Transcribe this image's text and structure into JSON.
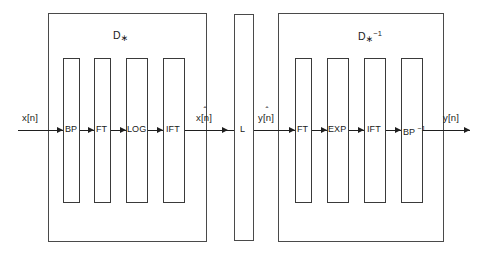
{
  "figure": {
    "type": "block-diagram"
  },
  "systems": [
    {
      "id": "characteristic-system",
      "label_base": "D",
      "label_sub": "∗",
      "label_sup": "",
      "stages": [
        "BP",
        "FT",
        "LOG",
        "IFT"
      ]
    },
    {
      "id": "linear-system",
      "label_base": "L",
      "label_sub": "",
      "label_sup": "",
      "stages": [
        "L"
      ]
    },
    {
      "id": "inverse-characteristic-system",
      "label_base": "D",
      "label_sub": "∗",
      "label_sup": "−1",
      "stages": [
        "FT",
        "EXP",
        "IFT",
        "BP"
      ]
    }
  ],
  "stage_labels": {
    "left": [
      {
        "name": "bandpass",
        "text": "BP",
        "sup": ""
      },
      {
        "name": "fourier-transform",
        "text": "FT",
        "sup": ""
      },
      {
        "name": "logarithm",
        "text": "LOG",
        "sup": ""
      },
      {
        "name": "inverse-fourier-transform",
        "text": "IFT",
        "sup": ""
      }
    ],
    "middle": [
      {
        "name": "linear-filter",
        "text": "L",
        "sup": ""
      }
    ],
    "right": [
      {
        "name": "fourier-transform",
        "text": "FT",
        "sup": ""
      },
      {
        "name": "exponential",
        "text": "EXP",
        "sup": ""
      },
      {
        "name": "inverse-fourier-transform",
        "text": "IFT",
        "sup": ""
      },
      {
        "name": "inverse-bandpass",
        "text": "BP",
        "sup": "−1"
      }
    ]
  },
  "signals": {
    "input": {
      "base": "x[n]",
      "hat": ""
    },
    "complex_cepstrum_in": {
      "base": "x[n]",
      "hat": "ˆ"
    },
    "complex_cepstrum_out": {
      "base": "y[n]",
      "hat": "ˆ"
    },
    "output": {
      "base": "y[n]",
      "hat": ""
    }
  },
  "system_labels": {
    "left_base": "D",
    "left_sub": "∗",
    "right_base": "D",
    "right_sub": "∗",
    "right_sup": "−1"
  },
  "colors": {
    "background": "#ffffff",
    "line": "#3c3c3c",
    "wire": "#1f1f1f",
    "text": "#1a1a1a"
  }
}
